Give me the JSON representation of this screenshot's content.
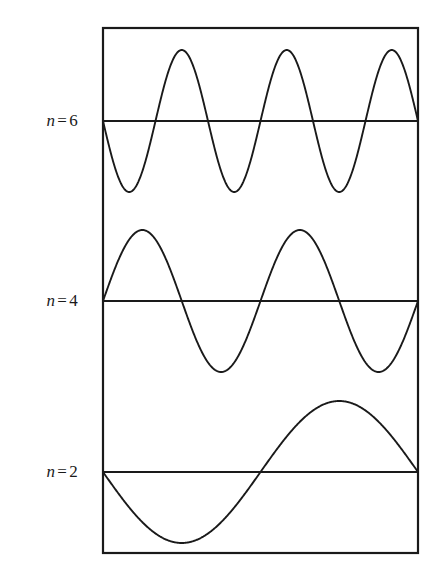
{
  "figure": {
    "background_color": "#ffffff",
    "stroke_color": "#1a1a1a",
    "frame": {
      "x": 103,
      "y": 28,
      "width": 315,
      "height": 525,
      "stroke_width": 2.2
    }
  },
  "labels": {
    "n6": {
      "var": "n",
      "eq": "=",
      "num": "6"
    },
    "n4": {
      "var": "n",
      "eq": "=",
      "num": "4"
    },
    "n2": {
      "var": "n",
      "eq": "=",
      "num": "2"
    }
  },
  "chart_data": {
    "type": "line",
    "xlabel": "",
    "ylabel": "",
    "grid": false,
    "legend_position": "left",
    "axis_box": {
      "x_min": 103,
      "x_max": 418,
      "y_min": 28,
      "y_max": 553
    },
    "xlim": [
      0,
      1
    ],
    "ylim": [
      -1,
      1
    ],
    "series": [
      {
        "name": "n = 6",
        "label": "n = 6",
        "mode_number": 6,
        "cycles": 3,
        "phase": "negative-sine",
        "formula": "y = -A sin(6 pi x / L)",
        "baseline_y": 121,
        "amplitude_px": 71,
        "peaks_x": [
          176,
          280,
          385
        ],
        "troughs_x": [
          133,
          237,
          342
        ],
        "nodes_x": [
          103,
          155,
          208,
          260,
          313,
          365,
          418
        ],
        "color": "#1a1a1a"
      },
      {
        "name": "n = 4",
        "label": "n = 4",
        "mode_number": 4,
        "cycles": 2,
        "phase": "positive-sine",
        "formula": "y = A sin(4 pi x / L)",
        "baseline_y": 301,
        "amplitude_px": 71,
        "peaks_x": [
          142,
          300
        ],
        "troughs_x": [
          221,
          379
        ],
        "nodes_x": [
          103,
          182,
          261,
          340,
          418
        ],
        "color": "#1a1a1a"
      },
      {
        "name": "n = 2",
        "label": "n = 2",
        "mode_number": 2,
        "cycles": 1,
        "phase": "negative-sine",
        "formula": "y = -A sin(2 pi x / L)",
        "baseline_y": 472,
        "amplitude_px": 71,
        "peaks_x": [
          339
        ],
        "troughs_x": [
          181
        ],
        "nodes_x": [
          103,
          261,
          418
        ],
        "color": "#1a1a1a"
      }
    ],
    "baselines": [
      {
        "name": "n = 6",
        "y": 121
      },
      {
        "name": "n = 4",
        "y": 301
      },
      {
        "name": "n = 2",
        "y": 472
      }
    ]
  }
}
